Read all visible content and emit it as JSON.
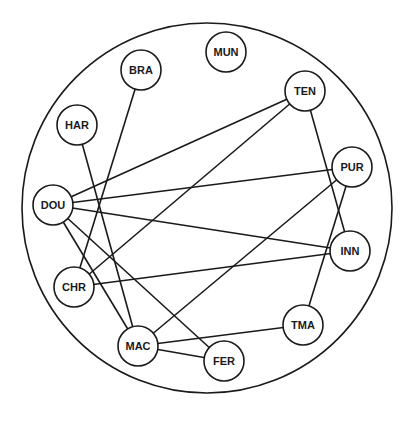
{
  "diagram": {
    "type": "network-graph",
    "outer_circle": {
      "cx": 207,
      "cy": 208,
      "r": 185
    },
    "node_radius": 20,
    "stroke_color": "#1a1a1a",
    "fill_color": "#ffffff",
    "nodes": [
      {
        "id": "BRA",
        "label": "BRA",
        "x": 141,
        "y": 70
      },
      {
        "id": "MUN",
        "label": "MUN",
        "x": 226,
        "y": 52
      },
      {
        "id": "TEN",
        "label": "TEN",
        "x": 305,
        "y": 91
      },
      {
        "id": "HAR",
        "label": "HAR",
        "x": 77,
        "y": 125
      },
      {
        "id": "PUR",
        "label": "PUR",
        "x": 352,
        "y": 167
      },
      {
        "id": "DOU",
        "label": "DOU",
        "x": 53,
        "y": 205
      },
      {
        "id": "INN",
        "label": "INN",
        "x": 350,
        "y": 251
      },
      {
        "id": "CHR",
        "label": "CHR",
        "x": 74,
        "y": 287
      },
      {
        "id": "TMA",
        "label": "TMA",
        "x": 303,
        "y": 325
      },
      {
        "id": "MAC",
        "label": "MAC",
        "x": 138,
        "y": 346
      },
      {
        "id": "FER",
        "label": "FER",
        "x": 224,
        "y": 361
      }
    ],
    "edges": [
      [
        "BRA",
        "CHR"
      ],
      [
        "HAR",
        "MAC"
      ],
      [
        "DOU",
        "TEN"
      ],
      [
        "DOU",
        "PUR"
      ],
      [
        "DOU",
        "INN"
      ],
      [
        "DOU",
        "MAC"
      ],
      [
        "DOU",
        "FER"
      ],
      [
        "CHR",
        "TEN"
      ],
      [
        "CHR",
        "INN"
      ],
      [
        "MAC",
        "PUR"
      ],
      [
        "MAC",
        "TMA"
      ],
      [
        "MAC",
        "FER"
      ],
      [
        "TEN",
        "INN"
      ],
      [
        "PUR",
        "TMA"
      ]
    ]
  }
}
